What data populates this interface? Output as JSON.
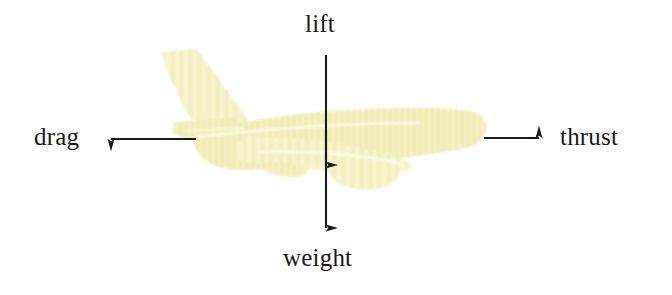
{
  "figure": {
    "background_color": "#ffffff",
    "width": 672,
    "height": 295
  },
  "aircraft": {
    "name": "airliner-silhouette",
    "orientation": "nose-right",
    "fill_color": "#f2efbc",
    "fill_color_light": "#f7f4cf",
    "fill_color_shadow": "#e8e2a8",
    "outline_color": "#ffffff",
    "texture": "vertical-streak"
  },
  "forces": [
    {
      "id": "lift",
      "label": "lift",
      "direction": "up",
      "arrow_color": "#1a1a1a",
      "from": {
        "x": 326,
        "y": 165
      },
      "to": {
        "x": 326,
        "y": 42
      }
    },
    {
      "id": "weight",
      "label": "weight",
      "direction": "down",
      "arrow_color": "#1a1a1a",
      "from": {
        "x": 326,
        "y": 130
      },
      "to": {
        "x": 326,
        "y": 240
      }
    },
    {
      "id": "drag",
      "label": "drag",
      "direction": "left",
      "arrow_color": "#1a1a1a",
      "from": {
        "x": 196,
        "y": 139
      },
      "to": {
        "x": 99,
        "y": 139
      }
    },
    {
      "id": "thrust",
      "label": "thrust",
      "direction": "right",
      "arrow_color": "#1a1a1a",
      "from": {
        "x": 484,
        "y": 138
      },
      "to": {
        "x": 551,
        "y": 138
      }
    }
  ]
}
